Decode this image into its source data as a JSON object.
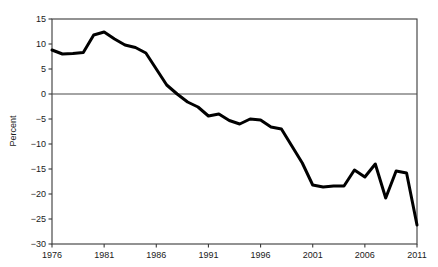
{
  "chart_data": {
    "type": "line",
    "title": "",
    "subtitle": "",
    "xlabel": "",
    "ylabel": "Percent",
    "xlim": [
      1976,
      2011
    ],
    "ylim": [
      -30,
      15
    ],
    "grid": false,
    "legend": null,
    "zero_line": 0,
    "xticks": [
      1976,
      1981,
      1986,
      1991,
      1996,
      2001,
      2006,
      2011
    ],
    "xtick_labels": [
      "1976",
      "1981",
      "1986",
      "1991",
      "1996",
      "2001",
      "2006",
      "2011"
    ],
    "yticks": [
      15,
      10,
      5,
      0,
      -5,
      -10,
      -15,
      -20,
      -25,
      -30
    ],
    "ytick_labels": [
      "15",
      "10",
      "5",
      "0",
      "−5",
      "−10",
      "−15",
      "−20",
      "−25",
      "−30"
    ],
    "series": [
      {
        "name": "Percent",
        "color": "#000000",
        "line_width": 3,
        "x": [
          1976,
          1977,
          1978,
          1979,
          1980,
          1981,
          1982,
          1983,
          1984,
          1985,
          1986,
          1987,
          1988,
          1989,
          1990,
          1991,
          1992,
          1993,
          1994,
          1995,
          1996,
          1997,
          1998,
          1999,
          2000,
          2001,
          2002,
          2003,
          2004,
          2005,
          2006,
          2007,
          2008,
          2009,
          2010,
          2011
        ],
        "values": [
          8.8,
          8.0,
          8.1,
          8.3,
          11.8,
          12.4,
          11.0,
          9.8,
          9.3,
          8.2,
          5.0,
          1.8,
          0.0,
          -1.6,
          -2.6,
          -4.4,
          -4.0,
          -5.3,
          -6.0,
          -5.0,
          -5.2,
          -6.6,
          -7.0,
          -10.4,
          -13.8,
          -18.2,
          -18.6,
          -18.4,
          -18.4,
          -15.2,
          -16.6,
          -14.0,
          -20.8,
          -15.4,
          -15.8,
          -26.2
        ]
      }
    ]
  }
}
